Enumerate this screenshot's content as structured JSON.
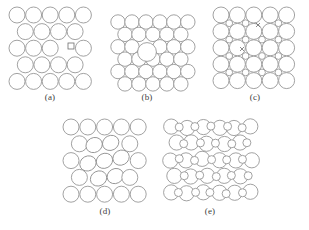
{
  "figure": {
    "background_color": "#ffffff",
    "atom_outline_color": "#8a8a8a",
    "marker_color": "#6e6e6e",
    "label_color": "#3d3d3d",
    "width": 309,
    "height": 230
  },
  "panels": [
    {
      "id": "a",
      "label": "(a)",
      "caption": "square lattice with a vacancy marked by a small square",
      "x": 8,
      "y": 6,
      "width": 84,
      "height": 84,
      "lattice_type": "square-offset",
      "atom_radius": 8.0,
      "small_marker": {
        "type": "square",
        "size": 6,
        "cx": 63,
        "cy": 40
      },
      "rows": 5,
      "cols": 5
    },
    {
      "id": "b",
      "label": "(b)",
      "caption": "close-packed lattice with one oversized substitutional atom",
      "x": 110,
      "y": 14,
      "width": 74,
      "height": 74,
      "lattice_type": "close-packed",
      "atom_radius": 7.2,
      "defect_atom": {
        "type": "substitutional-large",
        "radius": 9.4,
        "cx": 37,
        "cy": 38
      },
      "rows": 6,
      "cols": 6
    },
    {
      "id": "c",
      "label": "(c)",
      "caption": "ionic lattice of large anions and small cations with two vacancies marked by crosses",
      "x": 212,
      "y": 6,
      "width": 86,
      "height": 84,
      "lattice_type": "binary-square",
      "large_radius": 8.0,
      "small_radius": 3.4,
      "crosses": [
        {
          "cx": 46,
          "cy": 19,
          "size": 4
        },
        {
          "cx": 30,
          "cy": 43,
          "size": 4
        }
      ],
      "rows": 5,
      "cols": 5
    },
    {
      "id": "d",
      "label": "(d)",
      "caption": "lattice with a locally distorted, rotated core region",
      "x": 62,
      "y": 118,
      "width": 86,
      "height": 86,
      "lattice_type": "square-distorted",
      "atom_radius": 8.0,
      "distorted_region": {
        "rotation_deg": -28,
        "cx": 43,
        "cy": 43,
        "radius": 26
      },
      "rows": 5,
      "cols": 5
    },
    {
      "id": "e",
      "label": "(e)",
      "caption": "binary lattice of large and small atoms with interstitial disorder",
      "x": 162,
      "y": 118,
      "width": 96,
      "height": 86,
      "lattice_type": "binary-mixed",
      "large_radius": 7.6,
      "small_radius": 4.0,
      "rows": 5,
      "cols": 6
    }
  ],
  "chart_data": {
    "type": "diagram",
    "panel_ids": [
      "a",
      "b",
      "c",
      "d",
      "e"
    ],
    "panel_labels": [
      "(a)",
      "(b)",
      "(c)",
      "(d)",
      "(e)"
    ],
    "panel_descriptions": [
      "Square lattice containing a vacancy (missing atom) indicated by a small open square.",
      "Close-packed lattice containing a larger substitutional impurity atom.",
      "Ionic lattice of alternating large and small ions with two vacancies marked by crosses (Schottky-type pair).",
      "Lattice with a locally rotated and distorted group of atoms producing strain.",
      "Binary lattice of large and small atoms showing interstitial and size disorder."
    ]
  }
}
